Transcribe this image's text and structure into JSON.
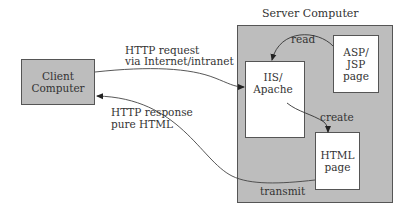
{
  "diagram": {
    "server": {
      "title": "Server Computer",
      "fill": "#bdbdbd"
    },
    "nodes": {
      "client": {
        "label": "Client\nComputer",
        "fill": "#bdbdbd"
      },
      "webserver": {
        "label": "IIS/\nApache",
        "fill": "#ffffff"
      },
      "source_page": {
        "label": "ASP/\nJSP\npage",
        "fill": "#ffffff"
      },
      "html_page": {
        "label": "HTML\npage",
        "fill": "#ffffff"
      }
    },
    "edges": {
      "request": {
        "label_line1": "HTTP request",
        "label_line2": "via Internet/intranet"
      },
      "response": {
        "label_line1": "HTTP response",
        "label_line2": "pure HTML"
      },
      "read": {
        "label": "read"
      },
      "create": {
        "label": "create"
      },
      "transmit": {
        "label": "transmit"
      }
    }
  }
}
